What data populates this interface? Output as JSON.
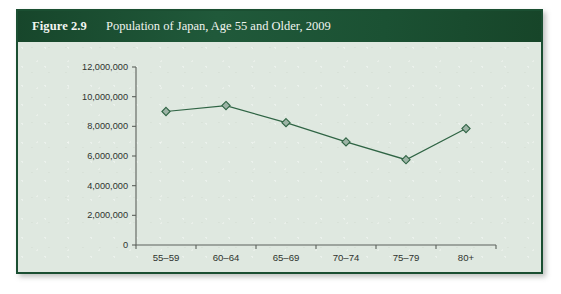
{
  "figure": {
    "number": "Figure 2.9",
    "title": "Population of Japan, Age 55 and Older, 2009"
  },
  "colors": {
    "header_band": "#1d5434",
    "card_border": "#1b4f32",
    "plot_background": "#dfe8e0",
    "series_line": "#2f6444",
    "marker_fill": "#9db4a6",
    "axis": "#5c615c"
  },
  "chart_data": {
    "type": "line",
    "title": "Population of Japan, Age 55 and Older, 2009",
    "xlabel": "",
    "ylabel": "",
    "categories": [
      "55–59",
      "60–64",
      "65–69",
      "70–74",
      "75–79",
      "80+"
    ],
    "values": [
      9000000,
      9400000,
      8250000,
      6950000,
      5750000,
      7850000
    ],
    "series": [
      {
        "name": "Population",
        "values": [
          9000000,
          9400000,
          8250000,
          6950000,
          5750000,
          7850000
        ]
      }
    ],
    "ylim": [
      0,
      12000000
    ],
    "ytick_values": [
      0,
      2000000,
      4000000,
      6000000,
      8000000,
      10000000,
      12000000
    ],
    "ytick_labels": [
      "0",
      "2,000,000",
      "4,000,000",
      "6,000,000",
      "8,000,000",
      "10,000,000",
      "12,000,000"
    ],
    "grid": false,
    "legend": false,
    "legend_position": "none",
    "marker": "diamond"
  }
}
